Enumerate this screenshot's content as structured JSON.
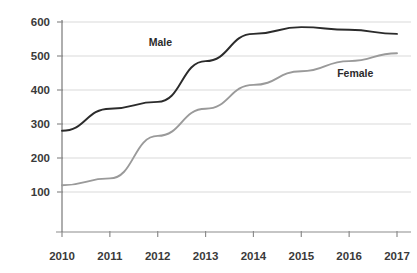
{
  "chart_data": {
    "type": "line",
    "title": "",
    "xlabel": "",
    "ylabel": "",
    "categories": [
      "2010",
      "2011",
      "2012",
      "2013",
      "2014",
      "2015",
      "2016",
      "2017"
    ],
    "x": [
      2010,
      2011,
      2012,
      2013,
      2014,
      2015,
      2016,
      2017
    ],
    "series": [
      {
        "name": "Male",
        "color": "#2b2b2b",
        "values": [
          280,
          345,
          365,
          485,
          565,
          585,
          577,
          565
        ]
      },
      {
        "name": "Female",
        "color": "#9a9a9a",
        "values": [
          120,
          140,
          265,
          345,
          415,
          455,
          485,
          508
        ]
      }
    ],
    "yticks": [
      100,
      200,
      300,
      400,
      500,
      600
    ],
    "ytick_labels": [
      "100",
      "200",
      "300",
      "400",
      "500",
      "600"
    ],
    "ylim": [
      0,
      620
    ],
    "xlim": [
      2010,
      2017
    ],
    "grid": true,
    "grid_color": "#d9d9d9",
    "axis_color": "#8c8c8c",
    "legend": "inline-annotations",
    "annotations": [
      {
        "text": "Male",
        "x": 2012,
        "y": 540
      },
      {
        "text": "Female",
        "x": 2016,
        "y": 450
      }
    ],
    "background": "#ffffff"
  },
  "axis": {
    "y_labels": [
      "600",
      "500",
      "400",
      "300",
      "200",
      "100"
    ],
    "x_labels": [
      "2010",
      "2011",
      "2012",
      "2013",
      "2014",
      "2015",
      "2016",
      "2017"
    ]
  },
  "labels": {
    "male": "Male",
    "female": "Female"
  }
}
